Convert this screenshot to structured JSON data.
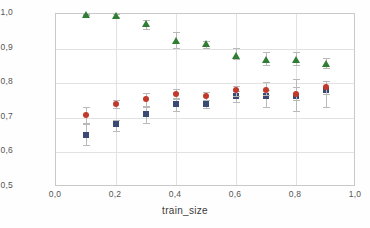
{
  "chart_data": {
    "type": "scatter",
    "title": "",
    "xlabel": "train_size",
    "ylabel": "AUC-ROC",
    "xlim": [
      0.0,
      1.0
    ],
    "ylim": [
      0.5,
      1.0
    ],
    "grid": true,
    "legend_position": "none",
    "xticks": [
      0.0,
      0.2,
      0.4,
      0.6,
      0.8,
      1.0
    ],
    "xtick_labels": [
      "0,0",
      "0,2",
      "0,4",
      "0,6",
      "0,8",
      "1,0"
    ],
    "yticks": [
      0.5,
      0.6,
      0.7,
      0.8,
      0.9,
      1.0
    ],
    "ytick_labels": [
      "0,5",
      "0,6",
      "0,7",
      "0,8",
      "0,9",
      "1,0"
    ],
    "x": [
      0.1,
      0.2,
      0.3,
      0.4,
      0.5,
      0.6,
      0.7,
      0.8,
      0.9
    ],
    "series": [
      {
        "name": "green-triangle-series",
        "marker": "triangle",
        "color": "#2e7d32",
        "values": [
          0.998,
          0.995,
          0.97,
          0.923,
          0.912,
          0.879,
          0.867,
          0.866,
          0.855
        ],
        "err_low": [
          0.002,
          0.004,
          0.012,
          0.022,
          0.01,
          0.01,
          0.013,
          0.013,
          0.012
        ],
        "err_high": [
          0.002,
          0.004,
          0.012,
          0.026,
          0.009,
          0.022,
          0.022,
          0.024,
          0.018
        ]
      },
      {
        "name": "red-circle-series",
        "marker": "circle",
        "color": "#c0392b",
        "values": [
          0.708,
          0.739,
          0.754,
          0.77,
          0.762,
          0.779,
          0.781,
          0.768,
          0.789
        ],
        "err_low": [
          0.026,
          0.012,
          0.02,
          0.014,
          0.012,
          0.015,
          0.016,
          0.018,
          0.021
        ],
        "err_high": [
          0.024,
          0.012,
          0.018,
          0.013,
          0.012,
          0.014,
          0.022,
          0.044,
          0.016
        ]
      },
      {
        "name": "blue-square-series",
        "marker": "square",
        "color": "#3b4a73",
        "values": [
          0.65,
          0.681,
          0.71,
          0.741,
          0.74,
          0.764,
          0.762,
          0.764,
          0.78
        ],
        "err_low": [
          0.029,
          0.019,
          0.026,
          0.022,
          0.012,
          0.018,
          0.031,
          0.044,
          0.05
        ],
        "err_high": [
          0.036,
          0.014,
          0.02,
          0.014,
          0.011,
          0.014,
          0.018,
          0.024,
          0.027
        ]
      }
    ]
  }
}
